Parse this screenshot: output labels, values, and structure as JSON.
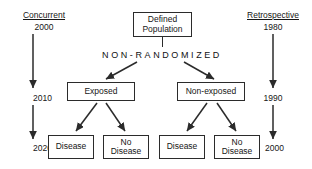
{
  "diagram": {
    "title_left": "Concurrent",
    "title_right": "Retrospective",
    "banner": "NON-RANDOMIZED",
    "left_timeline": {
      "label": "Concurrent",
      "years": [
        "2000",
        "2010",
        "2020"
      ]
    },
    "right_timeline": {
      "label": "Retrospective",
      "years": [
        "1980",
        "1990",
        "2000"
      ]
    },
    "nodes": {
      "population": "Defined\nPopulation",
      "population_line1": "Defined",
      "population_line2": "Population",
      "exposed": "Exposed",
      "non_exposed": "Non-exposed",
      "outcome_1": "Disease",
      "outcome_2_line1": "No",
      "outcome_2_line2": "Disease",
      "outcome_3": "Disease",
      "outcome_4_line1": "No",
      "outcome_4_line2": "Disease"
    },
    "colors": {
      "stroke": "#2b2b2b",
      "text": "#161616",
      "background": "#ffffff"
    }
  }
}
